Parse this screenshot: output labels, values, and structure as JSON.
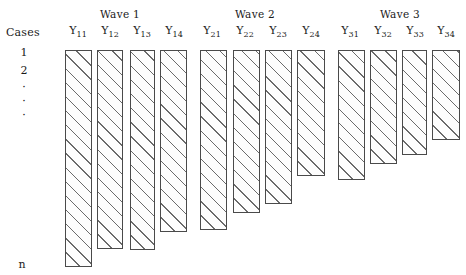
{
  "figure": {
    "background_color": "#ffffff",
    "bar_fill_color": "#fdfdfd",
    "bar_border_color": "#4a4a4a",
    "hatch_color": "#6b6b6b",
    "hatch_angle_deg": 45
  },
  "cases_axis": {
    "title": "Cases",
    "rows": [
      "1",
      "2"
    ],
    "ellipsis": [
      "·",
      "·",
      "·"
    ],
    "last_row": "n"
  },
  "waves": [
    {
      "title": "Wave 1",
      "columns": [
        {
          "base": "Y",
          "sub": "11"
        },
        {
          "base": "Y",
          "sub": "12"
        },
        {
          "base": "Y",
          "sub": "13"
        },
        {
          "base": "Y",
          "sub": "14"
        }
      ]
    },
    {
      "title": "Wave 2",
      "columns": [
        {
          "base": "Y",
          "sub": "21"
        },
        {
          "base": "Y",
          "sub": "22"
        },
        {
          "base": "Y",
          "sub": "23"
        },
        {
          "base": "Y",
          "sub": "24"
        }
      ]
    },
    {
      "title": "Wave 3",
      "columns": [
        {
          "base": "Y",
          "sub": "31"
        },
        {
          "base": "Y",
          "sub": "32"
        },
        {
          "base": "Y",
          "sub": "33"
        },
        {
          "base": "Y",
          "sub": "34"
        }
      ]
    }
  ],
  "chart_data": {
    "type": "bar",
    "title": "",
    "xlabel": "",
    "ylabel": "Cases",
    "orientation": "vertical-descending",
    "note": "Each bar represents the number of cases still observed at that measurement occasion; bar length shrinks across occasions to depict attrition.",
    "categories": [
      "Y11",
      "Y12",
      "Y13",
      "Y14",
      "Y21",
      "Y22",
      "Y23",
      "Y24",
      "Y31",
      "Y32",
      "Y33",
      "Y34"
    ],
    "group_labels": [
      "Wave 1",
      "Wave 1",
      "Wave 1",
      "Wave 1",
      "Wave 2",
      "Wave 2",
      "Wave 2",
      "Wave 2",
      "Wave 3",
      "Wave 3",
      "Wave 3",
      "Wave 3"
    ],
    "bar_top_px": [
      50,
      50,
      50,
      50,
      50,
      50,
      50,
      50,
      50,
      50,
      50,
      50
    ],
    "bar_bottom_px": [
      267,
      249,
      250,
      232,
      230,
      213,
      204,
      176,
      180,
      164,
      155,
      140
    ],
    "values": [
      217,
      199,
      200,
      182,
      180,
      163,
      154,
      126,
      130,
      114,
      105,
      90
    ],
    "bar_left_px": [
      65,
      97,
      130,
      160,
      200,
      233,
      265,
      297,
      338,
      370,
      402,
      432
    ],
    "bar_width_px": [
      27,
      26,
      25,
      27,
      27,
      27,
      27,
      28,
      27,
      27,
      25,
      28
    ],
    "grid": false,
    "legend": null
  },
  "layout": {
    "width": 466,
    "height": 275,
    "wave_title_centers_px": [
      120,
      255,
      400
    ],
    "column_label_centers_px": [
      78,
      110,
      142,
      174,
      212,
      245,
      278,
      311,
      350,
      383,
      415,
      446
    ],
    "case_row_y_px": [
      46,
      64
    ],
    "case_dot_y_px": [
      86,
      100,
      114
    ],
    "case_last_y_px": [
      258
    ]
  }
}
